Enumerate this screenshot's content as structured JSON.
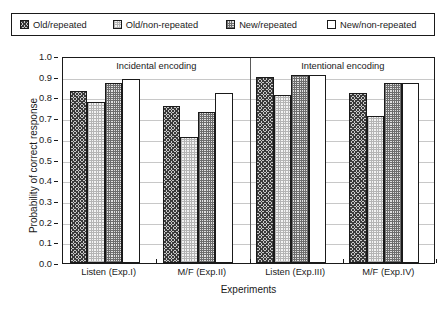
{
  "chart_data": {
    "type": "bar",
    "title": "",
    "xlabel": "Experiments",
    "ylabel": "Probability of correct response",
    "ylim": [
      0.0,
      1.0
    ],
    "ytick_labels": [
      "0.0",
      "0.1",
      "0.2",
      "0.3",
      "0.4",
      "0.5",
      "0.6",
      "0.7",
      "0.8",
      "0.9",
      "1.0"
    ],
    "ytick_values": [
      0.0,
      0.1,
      0.2,
      0.3,
      0.4,
      0.5,
      0.6,
      0.7,
      0.8,
      0.9,
      1.0
    ],
    "grid": true,
    "legend_position": "top",
    "categories": [
      "Listen (Exp.I)",
      "M/F (Exp.II)",
      "Listen (Exp.III)",
      "M/F (Exp.IV)"
    ],
    "series": [
      {
        "name": "Old/repeated",
        "pattern": "dark-diagonal-hatch",
        "values": [
          0.83,
          0.76,
          0.9,
          0.82
        ]
      },
      {
        "name": "Old/non-repeated",
        "pattern": "light-dotted",
        "values": [
          0.78,
          0.61,
          0.81,
          0.71
        ]
      },
      {
        "name": "New/repeated",
        "pattern": "medium-checkered",
        "values": [
          0.87,
          0.73,
          0.91,
          0.87
        ]
      },
      {
        "name": "New/non-repeated",
        "pattern": "empty-white",
        "values": [
          0.89,
          0.82,
          0.91,
          0.87
        ]
      }
    ],
    "annotations": [
      {
        "text": "Incidental encoding",
        "spans_categories": [
          "Listen (Exp.I)",
          "M/F (Exp.II)"
        ]
      },
      {
        "text": "Intentional encoding",
        "spans_categories": [
          "Listen (Exp.III)",
          "M/F (Exp.IV)"
        ]
      }
    ],
    "divider_after_category": "M/F (Exp.II)"
  },
  "legend": {
    "items": [
      {
        "label": "Old/repeated"
      },
      {
        "label": "Old/non-repeated"
      },
      {
        "label": "New/repeated"
      },
      {
        "label": "New/non-repeated"
      }
    ]
  },
  "colors": {
    "frame": "#1a1a1a",
    "gridline": "#c8c8c8",
    "divider": "#5a5a5a",
    "text": "#1a1a1a",
    "background": "#ffffff"
  }
}
